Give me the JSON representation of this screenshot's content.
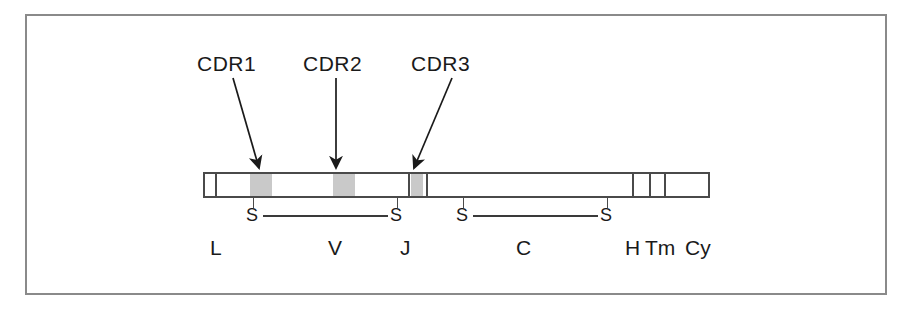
{
  "figure": {
    "border_color": "#8a8a8a",
    "bar_outline_color": "#4a4a4a",
    "cdr_block_color": "#c9c9c9",
    "text_color": "#1a1a1a"
  },
  "callouts": [
    {
      "label": "CDR1",
      "label_x": 197,
      "label_y": 52,
      "arrow": {
        "x1": 233,
        "y1": 78,
        "x2": 261,
        "y2": 170,
        "type": "diagonal-right-down"
      }
    },
    {
      "label": "CDR2",
      "label_x": 303,
      "label_y": 52,
      "arrow": {
        "x1": 336,
        "y1": 78,
        "x2": 336,
        "y2": 170,
        "type": "vertical-down"
      }
    },
    {
      "label": "CDR3",
      "label_x": 411,
      "label_y": 52,
      "arrow": {
        "x1": 452,
        "y1": 78,
        "x2": 413,
        "y2": 170,
        "type": "diagonal-left-down"
      }
    }
  ],
  "bar": {
    "x": 203,
    "y": 172,
    "width": 507,
    "height": 26,
    "dividers": [
      10,
      203,
      221,
      427,
      444,
      459,
      505
    ],
    "cdr_blocks": [
      {
        "name": "CDR1",
        "left": 45,
        "width": 22
      },
      {
        "name": "CDR2",
        "left": 128,
        "width": 22
      },
      {
        "name": "CDR3",
        "left": 206,
        "width": 12
      }
    ]
  },
  "disulfides": [
    {
      "left_label": "S",
      "right_label": "S",
      "left_x": 252,
      "right_x": 396,
      "y": 212,
      "tick_x1": 253,
      "tick_x2": 397
    },
    {
      "left_label": "S",
      "right_label": "S",
      "left_x": 462,
      "right_x": 606,
      "y": 212,
      "tick_x1": 463,
      "tick_x2": 607
    }
  ],
  "domain_labels": [
    {
      "text": "L",
      "x": 210,
      "y": 236
    },
    {
      "text": "V",
      "x": 328,
      "y": 236
    },
    {
      "text": "J",
      "x": 400,
      "y": 236
    },
    {
      "text": "C",
      "x": 516,
      "y": 236
    },
    {
      "text": "H",
      "x": 625,
      "y": 236
    },
    {
      "text": "Tm",
      "x": 645,
      "y": 236
    },
    {
      "text": "Cy",
      "x": 685,
      "y": 236
    }
  ]
}
